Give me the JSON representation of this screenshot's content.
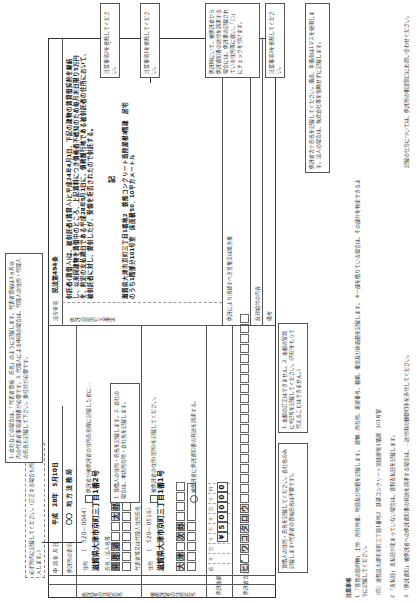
{
  "form": {
    "top_note": "必ず所内に記載してください。(訂正する場合も所内に記入します。)",
    "application_date_label": "申 請 年 月 日",
    "application_date": "平成　28年　5月10日",
    "office_label": "供託所の表示",
    "office_value": "〇〇　地 方 法 務 局",
    "depositor_section_label": "供託者の住所氏名",
    "depositor": {
      "postal_label": "住所",
      "postal": "（　520－0044）",
      "address": "滋賀県大津市京町三丁目1番2号",
      "name_label": "氏名・法人名等",
      "name_cells": [
        "開",
        "郡",
        "湖",
        "",
        "",
        "太",
        "郎"
      ],
      "rep_label": "代表者等又は代理人住所氏名"
    },
    "creditor_section_label": "被供託者の住所氏名",
    "creditor": {
      "postal_label": "住所",
      "postal": "（　520－0516）",
      "address": "滋賀県大津市京町三丁目1番1号",
      "name_cells": [
        "大",
        "津",
        "",
        "次",
        "郎",
        "",
        "",
        "",
        ""
      ]
    },
    "amount_label": "供託金額",
    "amount_units": [
      "",
      "億",
      "千",
      "百",
      "十",
      "万",
      "千",
      "百",
      "十",
      "円"
    ],
    "amount_values": [
      "",
      "",
      "",
      "¥",
      "5",
      "0",
      "0",
      "0",
      "0"
    ],
    "kana_label": "供託者カナ氏名",
    "kana_cells": [
      "ヒ",
      "゛",
      "ワ",
      "コ",
      "タ",
      "ロ",
      "ウ",
      "",
      "",
      "",
      "",
      "",
      "",
      "",
      "",
      "",
      "",
      "",
      "",
      "",
      "",
      "",
      "",
      "",
      "",
      ""
    ],
    "law_label": "法令条項",
    "law_value": "民法第494条",
    "deposit_reason_label": "供託の原因たる事実",
    "deposit_reason": "供託者(賃借人)は、被供託者(賃貸人)と平成24年4月1日、下記の建物の賃貸借契約を締結し、以来同建物を賃借中のところ、上記賃料につき債権者不確知のため毎月末日限り5万円を、約定の支払期日である平成28年5月1日に、債務履行地である被供託者の住所において、被供託者に対し、提供したが、受領を拒否されたので供託する。",
    "ki_label": "記",
    "property": "滋賀県大津市京町三丁目1番地2　鉄筋コンクリート造陸屋根3階建　居宅のうち1階部分101号室　床面積50．10平方メートル",
    "reaction_label": "反対給付の内容",
    "release_label": "供託により消滅すべき質権又は抵当権",
    "remarks_label": "備考",
    "check1": "供託者が被供託者の住所氏名欄に記載した者に…",
    "check2": "被供託者の住所(居所)を記載してください。",
    "check3": "被供託者に供託通知書の発送を請求する。",
    "kana_hint": "(本人記入欄)",
    "seal_label": "（年）"
  },
  "notes": {
    "n1": "注意事項2を参照してください。",
    "n2": "注意事項1を参照してください。",
    "n3": "注意事項3を参照してください。",
    "n4": "供託時にいて、被供託者から供託通知書の送付を請求する場合には、供託書の記載されている住所等に従い、「□」にチェックを付けます。",
    "n5": "供託者カナ氏名を記載してください。濁点、半濁点は1マスを使用します。法人の場合は、株式会社等を省略せずに記載します。",
    "n6": "1. 賃借人の住所・氏名を記載します。2. 会社の場合は、本店所在地・会社名を記載します。",
    "n7": "1. 会社などの場合は、「代表者資格　氏名」のように記載します。代表者資格は3ヵ月以内の代表者事項証明書が必要です。3. 代理人による申請の場合は、代理人の住所・代理人の氏名も記載して下さい。委任状が必要です。",
    "n8": "1. 金額の訂正はできません。2. 金額の冒頭に¥記号を記載してください。(円印をもって代えることはできません。)",
    "n9": "賃借人の住所・氏名を記載してください。会社名のみ記載します(代表者の資格氏名は不要です)。",
    "n10": "供託書の訂正はしないでください。記入に誤りがある場合は、新たな用紙に書き直してください。"
  },
  "bottom_notes": {
    "title": "注意事項",
    "items": [
      "1 「賃貸の目的物」 土地…所在地番、地目及び地積を記載します。 建物…所在地、家屋番号、種類、構造及び床面積を記載します。 ※一部を借りている場合は、その部分を特定できるように記載してください。",
      "2 「支払日」 支払日が定まっていない場合は、賃料支払日を記載します。",
      "3 「供託通知」 被供託者への供託通知書の発送を請求する場合は、…送付用の郵便切手を添付してください。"
    ],
    "item1_example": "（例）滋賀県大津市京町三丁目1番地2　鉄筋コンクリート造陸屋根3階建　101号室",
    "item2_text": "支払日が定まっていない場合は、賃料支払日を記載してください。",
    "side_text": "記載の仕方については、供託所の相談窓口にお問い合わせください。"
  }
}
